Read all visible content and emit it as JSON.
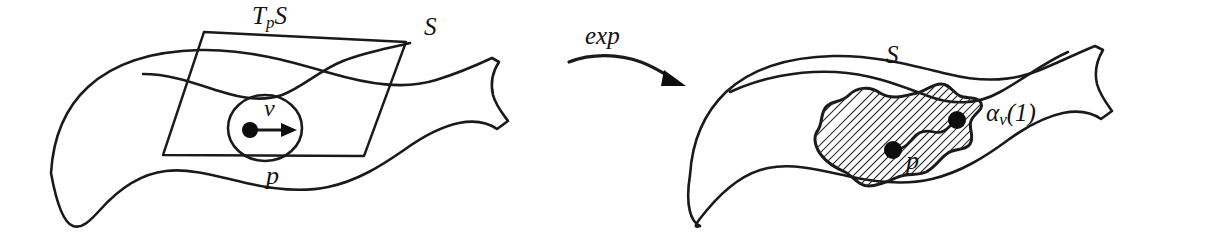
{
  "figure": {
    "background_color": "#ffffff",
    "ink_color": "#1a1a1a"
  },
  "left_panel": {
    "surface_label": "S",
    "tangent_plane_label_base": "T",
    "tangent_plane_label_sub": "p",
    "tangent_plane_label_tail": "S",
    "point_label": "p",
    "vector_label": "v"
  },
  "map_arrow": {
    "label": "exp",
    "direction": "left-to-right",
    "arrowhead": "arrow-head-icon"
  },
  "right_panel": {
    "surface_label": "S",
    "point_label": "p",
    "endpoint_label_base": "α",
    "endpoint_label_sub": "v",
    "endpoint_label_tail": "(1)",
    "region_fill": "diagonal-hatching"
  }
}
